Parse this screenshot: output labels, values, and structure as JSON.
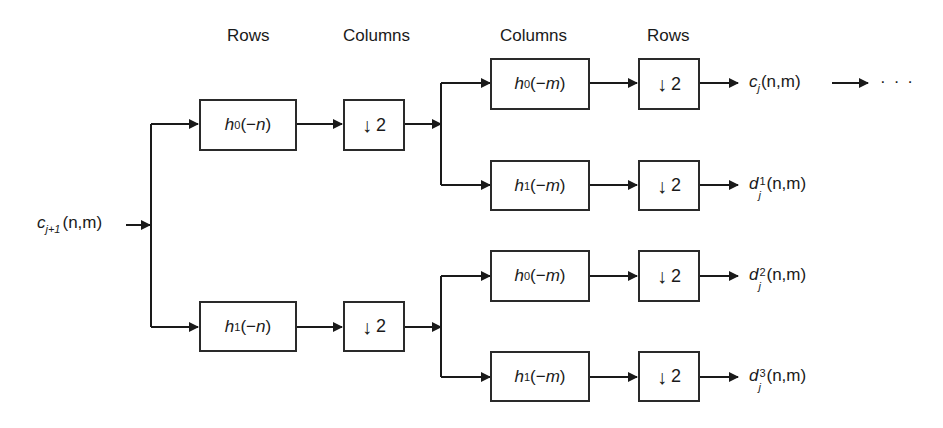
{
  "headers": {
    "stage1_filter": "Rows",
    "stage1_downsample": "Columns",
    "stage2_filter": "Columns",
    "stage2_downsample": "Rows"
  },
  "input": {
    "symbol": "c",
    "subscript": "j+1",
    "args": "(n,m)"
  },
  "stage1": [
    {
      "filter": {
        "h": "h",
        "index": "0",
        "arg_open": "(−",
        "var": "n",
        "arg_close": ")"
      },
      "downsample": {
        "arrow": "↓",
        "factor": "2"
      }
    },
    {
      "filter": {
        "h": "h",
        "index": "1",
        "arg_open": "(−",
        "var": "n",
        "arg_close": ")"
      },
      "downsample": {
        "arrow": "↓",
        "factor": "2"
      }
    }
  ],
  "stage2": [
    {
      "filter": {
        "h": "h",
        "index": "0",
        "arg_open": "(−",
        "var": "m",
        "arg_close": ")"
      },
      "downsample": {
        "arrow": "↓",
        "factor": "2"
      },
      "output": {
        "symbol": "c",
        "sup": "",
        "sub": "j",
        "args": "(n,m)"
      }
    },
    {
      "filter": {
        "h": "h",
        "index": "1",
        "arg_open": "(−",
        "var": "m",
        "arg_close": ")"
      },
      "downsample": {
        "arrow": "↓",
        "factor": "2"
      },
      "output": {
        "symbol": "d",
        "sup": "1",
        "sub": "j",
        "args": "(n,m)"
      }
    },
    {
      "filter": {
        "h": "h",
        "index": "0",
        "arg_open": "(−",
        "var": "m",
        "arg_close": ")"
      },
      "downsample": {
        "arrow": "↓",
        "factor": "2"
      },
      "output": {
        "symbol": "d",
        "sup": "2",
        "sub": "j",
        "args": "(n,m)"
      }
    },
    {
      "filter": {
        "h": "h",
        "index": "1",
        "arg_open": "(−",
        "var": "m",
        "arg_close": ")"
      },
      "downsample": {
        "arrow": "↓",
        "factor": "2"
      },
      "output": {
        "symbol": "d",
        "sup": "3",
        "sub": "j",
        "args": "(n,m)"
      }
    }
  ],
  "continuation": "···",
  "colors": {
    "line": "#1a1a1a",
    "box_border": "#2a2a2a",
    "background": "#ffffff"
  }
}
